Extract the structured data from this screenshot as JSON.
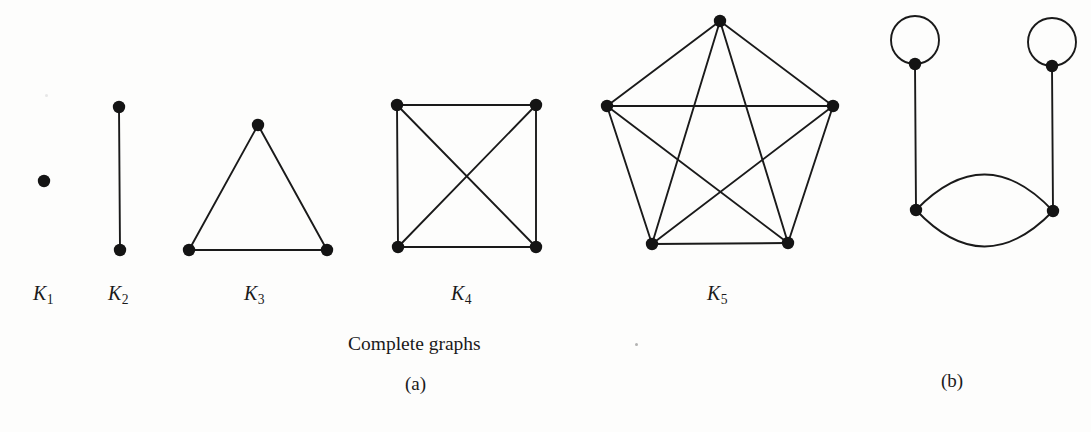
{
  "figure": {
    "background_color": "#fdfdfc",
    "ink_color": "#1a1a1a",
    "width": 1091,
    "height": 432,
    "vertex_radius": 6.2,
    "edge_width": 1.9
  },
  "captions": {
    "group_a_caption": "Complete graphs",
    "part_a_label": "(a)",
    "part_b_label": "(b)"
  },
  "graphs": [
    {
      "id": "k1",
      "name": "complete-graph-k1",
      "label_letter": "K",
      "label_index": "1",
      "label_x": 33,
      "label_y": 282,
      "vertices": [
        {
          "id": "v1",
          "x": 44,
          "y": 181
        }
      ],
      "edges": [],
      "loops": []
    },
    {
      "id": "k2",
      "name": "complete-graph-k2",
      "label_letter": "K",
      "label_index": "2",
      "label_x": 108,
      "label_y": 282,
      "vertices": [
        {
          "id": "v1",
          "x": 119,
          "y": 107
        },
        {
          "id": "v2",
          "x": 120,
          "y": 250
        }
      ],
      "edges": [
        [
          "v1",
          "v2"
        ]
      ],
      "loops": []
    },
    {
      "id": "k3",
      "name": "complete-graph-k3",
      "label_letter": "K",
      "label_index": "3",
      "label_x": 244,
      "label_y": 282,
      "vertices": [
        {
          "id": "v1",
          "x": 258,
          "y": 125
        },
        {
          "id": "v2",
          "x": 189,
          "y": 250
        },
        {
          "id": "v3",
          "x": 327,
          "y": 250
        }
      ],
      "edges": [
        [
          "v1",
          "v2"
        ],
        [
          "v1",
          "v3"
        ],
        [
          "v2",
          "v3"
        ]
      ],
      "loops": []
    },
    {
      "id": "k4",
      "name": "complete-graph-k4",
      "label_letter": "K",
      "label_index": "4",
      "label_x": 451,
      "label_y": 282,
      "vertices": [
        {
          "id": "v1",
          "x": 397,
          "y": 105
        },
        {
          "id": "v2",
          "x": 536,
          "y": 105
        },
        {
          "id": "v3",
          "x": 398,
          "y": 247
        },
        {
          "id": "v4",
          "x": 536,
          "y": 247
        }
      ],
      "edges": [
        [
          "v1",
          "v2"
        ],
        [
          "v1",
          "v3"
        ],
        [
          "v1",
          "v4"
        ],
        [
          "v2",
          "v3"
        ],
        [
          "v2",
          "v4"
        ],
        [
          "v3",
          "v4"
        ]
      ],
      "loops": []
    },
    {
      "id": "k5",
      "name": "complete-graph-k5",
      "label_letter": "K",
      "label_index": "5",
      "label_x": 707,
      "label_y": 282,
      "vertices": [
        {
          "id": "v1",
          "x": 720,
          "y": 21
        },
        {
          "id": "v2",
          "x": 607,
          "y": 106
        },
        {
          "id": "v3",
          "x": 833,
          "y": 106
        },
        {
          "id": "v4",
          "x": 652,
          "y": 244
        },
        {
          "id": "v5",
          "x": 788,
          "y": 243
        }
      ],
      "edges": [
        [
          "v1",
          "v2"
        ],
        [
          "v1",
          "v3"
        ],
        [
          "v1",
          "v4"
        ],
        [
          "v1",
          "v5"
        ],
        [
          "v2",
          "v3"
        ],
        [
          "v2",
          "v4"
        ],
        [
          "v2",
          "v5"
        ],
        [
          "v3",
          "v4"
        ],
        [
          "v3",
          "v5"
        ],
        [
          "v4",
          "v5"
        ]
      ],
      "loops": []
    },
    {
      "id": "multigraph-b",
      "name": "multigraph-with-loops",
      "label_letter": "",
      "label_index": "",
      "vertices": [
        {
          "id": "a",
          "x": 915,
          "y": 64
        },
        {
          "id": "b",
          "x": 1052,
          "y": 66
        },
        {
          "id": "c",
          "x": 916,
          "y": 210
        },
        {
          "id": "d",
          "x": 1053,
          "y": 211
        }
      ],
      "edges": [
        [
          "a",
          "c"
        ],
        [
          "b",
          "d"
        ],
        [
          "c",
          "d",
          36
        ],
        [
          "c",
          "d",
          -36
        ]
      ],
      "loops": [
        {
          "at": "a",
          "radius": 24,
          "direction": "up"
        },
        {
          "at": "b",
          "radius": 24,
          "direction": "up"
        }
      ]
    }
  ],
  "caption_positions": {
    "group_a_caption": {
      "x": 348,
      "y": 333
    },
    "part_a_label": {
      "x": 405,
      "y": 373
    },
    "part_b_label": {
      "x": 941,
      "y": 370
    }
  },
  "specks": [
    {
      "x": 635,
      "y": 343,
      "faint": false
    },
    {
      "x": 45,
      "y": 94,
      "faint": true
    }
  ]
}
